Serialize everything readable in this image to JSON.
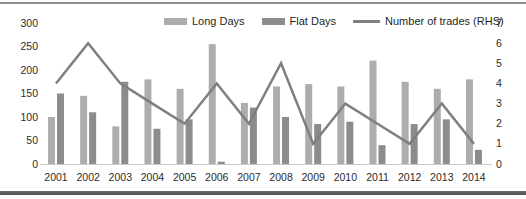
{
  "chart_data": {
    "type": "bar",
    "title": "",
    "xlabel": "",
    "ylabel": "",
    "categories": [
      "2001",
      "2002",
      "2003",
      "2004",
      "2005",
      "2006",
      "2007",
      "2008",
      "2009",
      "2010",
      "2011",
      "2012",
      "2013",
      "2014"
    ],
    "series": [
      {
        "name": "Long Days",
        "kind": "bar",
        "axis": "left",
        "color": "#adadad",
        "values": [
          100,
          145,
          80,
          180,
          160,
          255,
          130,
          165,
          170,
          165,
          220,
          175,
          160,
          180
        ]
      },
      {
        "name": "Flat Days",
        "kind": "bar",
        "axis": "left",
        "color": "#8c8c8c",
        "values": [
          150,
          110,
          175,
          75,
          95,
          5,
          120,
          100,
          85,
          90,
          40,
          85,
          95,
          30
        ]
      },
      {
        "name": "Number of trades (RHS)",
        "kind": "line",
        "axis": "right",
        "color": "#7f7f7f",
        "values": [
          4,
          6,
          4,
          3,
          2,
          4,
          2,
          5,
          1,
          3,
          2,
          1,
          3,
          1
        ]
      }
    ],
    "left_axis": {
      "min": 0,
      "max": 300,
      "ticks": [
        0,
        50,
        100,
        150,
        200,
        250,
        300
      ]
    },
    "right_axis": {
      "min": 0,
      "max": 7,
      "ticks": [
        0,
        1,
        2,
        3,
        4,
        5,
        6,
        7
      ]
    },
    "grid": false,
    "legend_position": "top"
  }
}
